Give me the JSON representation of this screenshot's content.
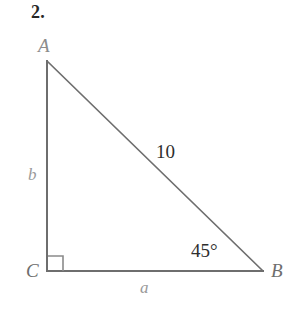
{
  "figure": {
    "problem_number": "2.",
    "background_color": "#ffffff",
    "stroke_color": "#6e6e6e",
    "label_color_light": "#9a9a9a",
    "label_color_dark": "#2e2e2e",
    "vertices": [
      {
        "name": "A",
        "label": "A",
        "x": 47,
        "y": 61
      },
      {
        "name": "B",
        "label": "B",
        "x": 263,
        "y": 271
      },
      {
        "name": "C",
        "label": "C",
        "x": 47,
        "y": 271
      }
    ],
    "sides": [
      {
        "name": "leg-vertical",
        "label": "b",
        "from": "A",
        "to": "C"
      },
      {
        "name": "leg-horizontal",
        "label": "a",
        "from": "C",
        "to": "B"
      },
      {
        "name": "hypotenuse",
        "label": "10",
        "from": "A",
        "to": "B"
      }
    ],
    "angles": [
      {
        "at": "C",
        "label": "",
        "marker": "right-angle-square",
        "measure": "90"
      },
      {
        "at": "B",
        "label": "45°",
        "marker": "none",
        "measure": "45"
      }
    ],
    "right_angle_marker": {
      "name": "right-angle-square",
      "x": 48,
      "y": 256,
      "size": 15
    }
  }
}
